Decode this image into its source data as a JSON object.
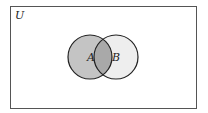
{
  "diagram": {
    "type": "venn",
    "universe_label": "U",
    "sets": [
      {
        "label": "A",
        "shaded": "medium-gray"
      },
      {
        "label": "B",
        "shaded": "light-gray"
      }
    ],
    "colors": {
      "a_only": "#c4c4c4",
      "intersection": "#a9a9a9",
      "b_only": "#eeeeee",
      "stroke": "#222222",
      "background": "#ffffff"
    }
  }
}
